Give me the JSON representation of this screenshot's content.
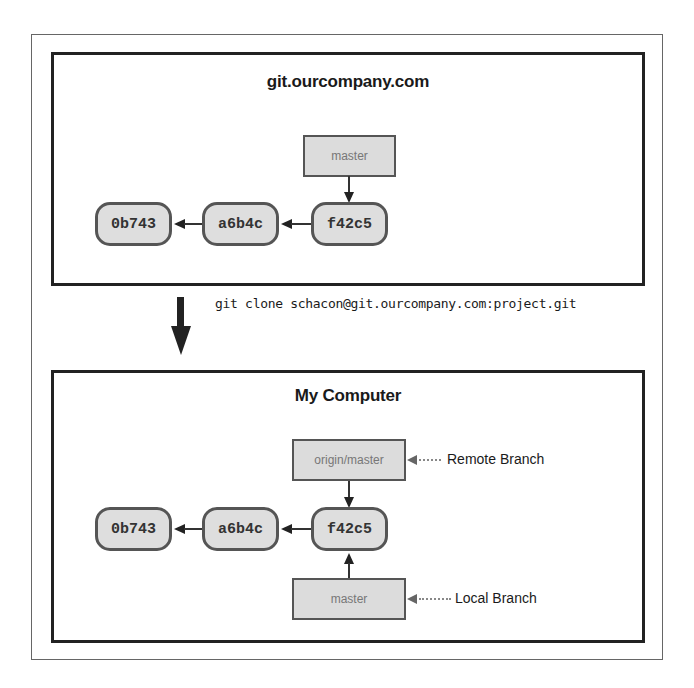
{
  "diagram": {
    "type": "git-clone-remote-local-branches",
    "server_panel": {
      "title": "git.ourcompany.com",
      "commits": [
        {
          "id": "0b743"
        },
        {
          "id": "a6b4c"
        },
        {
          "id": "f42c5"
        }
      ],
      "branch": {
        "label": "master",
        "points_to": "f42c5"
      }
    },
    "clone_command": "git clone schacon@git.ourcompany.com:project.git",
    "local_panel": {
      "title": "My Computer",
      "commits": [
        {
          "id": "0b743"
        },
        {
          "id": "a6b4c"
        },
        {
          "id": "f42c5"
        }
      ],
      "remote_branch": {
        "label": "origin/master",
        "points_to": "f42c5",
        "annotation": "Remote Branch"
      },
      "local_branch": {
        "label": "master",
        "points_to": "f42c5",
        "annotation": "Local Branch"
      }
    },
    "colors": {
      "commit_fill": "#dedede",
      "commit_border": "#555555",
      "branch_fill": "#dcdcdc",
      "panel_border": "#222222",
      "arrow": "#222222"
    }
  }
}
